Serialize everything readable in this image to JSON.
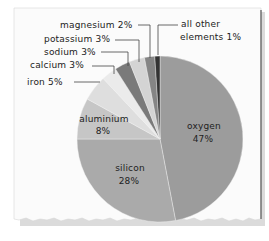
{
  "chart_data": {
    "type": "pie",
    "title": "",
    "start_angle_deg": 0,
    "direction": "clockwise",
    "slices": [
      {
        "label": "oxygen",
        "value": 47,
        "value_label": "47%",
        "color": "#9c9c9c"
      },
      {
        "label": "silicon",
        "value": 28,
        "value_label": "28%",
        "color": "#aaaaaa"
      },
      {
        "label": "aluminium",
        "value": 8,
        "value_label": "8%",
        "color": "#c6c6c6"
      },
      {
        "label": "iron",
        "value": 5,
        "value_label": "5%",
        "color": "#dedede"
      },
      {
        "label": "calcium",
        "value": 3,
        "value_label": "3%",
        "color": "#ebebeb"
      },
      {
        "label": "sodium",
        "value": 3,
        "value_label": "3%",
        "color": "#7a7a7a"
      },
      {
        "label": "potassium",
        "value": 3,
        "value_label": "3%",
        "color": "#d4d4d4"
      },
      {
        "label": "magnesium",
        "value": 2,
        "value_label": "2%",
        "color": "#858585"
      },
      {
        "label": "all other elements",
        "value": 1,
        "value_label": "1%",
        "color": "#333333"
      }
    ],
    "labels": {
      "oxygen": {
        "name": "oxygen",
        "pct": "47%"
      },
      "silicon": {
        "name": "silicon",
        "pct": "28%"
      },
      "aluminium": {
        "name": "aluminium",
        "pct": "8%"
      },
      "iron": "iron 5%",
      "calcium": "calcium 3%",
      "sodium": "sodium 3%",
      "potassium": "potassium 3%",
      "magnesium": "magnesium 2%",
      "other_line1": "all other",
      "other_line2": "elements 1%"
    },
    "legend": "none (callout labels)"
  }
}
